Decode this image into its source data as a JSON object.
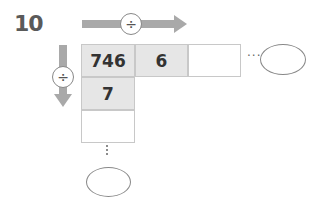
{
  "problem": {
    "number": "10"
  },
  "operators": {
    "horizontal": "÷",
    "vertical": "÷"
  },
  "row": [
    {
      "value": "746",
      "filled": true
    },
    {
      "value": "6",
      "filled": true
    },
    {
      "value": "",
      "filled": false
    }
  ],
  "column": [
    {
      "value": "746",
      "filled": true
    },
    {
      "value": "7",
      "filled": true
    },
    {
      "value": "",
      "filled": false
    }
  ],
  "continuation": {
    "horizontal": "···",
    "vertical": "⋮"
  },
  "colors": {
    "arrow": "#a9a9a9",
    "filled_cell": "#e6e6e6",
    "border": "#c8c8c8",
    "number_text": "#5a5a5a"
  }
}
